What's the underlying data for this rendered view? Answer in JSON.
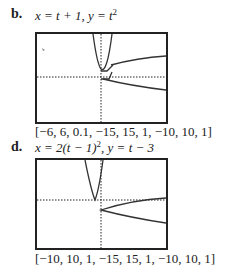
{
  "problems": [
    {
      "letter": "b.",
      "equation_x": "x = t + 1,",
      "equation_y": "y = t",
      "equation_y_exp": "2",
      "window": "[−6, 6, 0.1, −15, 15, 1, −10, 10, 1]"
    },
    {
      "letter": "d.",
      "equation_x": "x = 2(t − 1)",
      "equation_x_exp": "2",
      "equation_y": ", y = t − 3",
      "window": "[−10, 10, 1, −15, 15, 1, −10, 10, 1]"
    }
  ],
  "colors": {
    "curve": "#333333",
    "frame": "#222222"
  }
}
